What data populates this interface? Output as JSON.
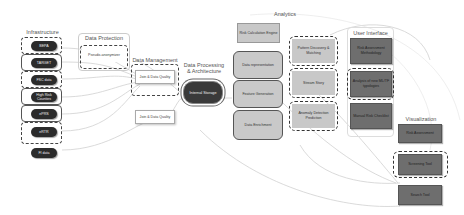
{
  "diagram": {
    "sections": {
      "infrastructure": "Infrastructure",
      "data_protection": "Data Protection",
      "data_management": "Data Management",
      "data_processing": "Data Processing\n& Architecture",
      "analytics": "Analytics",
      "user_interface": "User Interface",
      "visualization": "Visualization"
    },
    "infrastructure_nodes": [
      "BEPA",
      "TARGET",
      "FSC data",
      "High Risk Counties",
      "ePRS",
      "eRTR",
      "FI data"
    ],
    "data_protection_nodes": [
      "Pseudo-anonymizer"
    ],
    "data_management_nodes": [
      "Join & Data Quality",
      "Join & Data Quality"
    ],
    "data_processing_nodes": [
      "Internal Storage"
    ],
    "analytics_pipeline": [
      "Risk Calculation Engine",
      "Data representation",
      "Feature Generation",
      "Data Enrichment"
    ],
    "analytics_methods": [
      "Pattern Discovery & Matching",
      "Stream Story",
      "Anomaly Detection Prediction"
    ],
    "user_interface_nodes": [
      "Risk Assessment Methodology",
      "Analysis of new ML/TF typologies",
      "Manual Risk Checklist"
    ],
    "visualization_nodes": [
      "Risk Assessment",
      "Screening Tool",
      "Search Tool"
    ],
    "colors": {
      "dark_node": "#2b2b2b",
      "light_grey_node": "#c8c8c8",
      "dark_grey_node": "#6e6e6e",
      "link": "#cfcfcf"
    }
  }
}
